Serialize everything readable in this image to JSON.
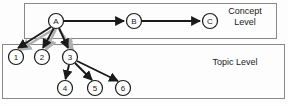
{
  "figure": {
    "background_color": "#ffffff",
    "stroke_color": "#1a1a1a",
    "shadow_color": "#a8a8a8",
    "box_border_color": "#7a7a7a",
    "width": 288,
    "height": 106
  },
  "groups": [
    {
      "id": "concept-level",
      "label": "Concept",
      "label_line2": "Level",
      "label_full": "Concept Level",
      "x": 24,
      "y": 3,
      "w": 253,
      "h": 36
    },
    {
      "id": "topic-level",
      "label": "Topic Level",
      "label_full": "Topic Level",
      "x": 2,
      "y": 44,
      "w": 283,
      "h": 55
    }
  ],
  "nodes": [
    {
      "id": "A",
      "label": "A",
      "cx": 56,
      "cy": 21,
      "r": 7.5,
      "level": "concept"
    },
    {
      "id": "B",
      "label": "B",
      "cx": 134,
      "cy": 21,
      "r": 7.5,
      "level": "concept"
    },
    {
      "id": "C",
      "label": "C",
      "cx": 210,
      "cy": 21,
      "r": 7.5,
      "level": "concept"
    },
    {
      "id": "1",
      "label": "1",
      "cx": 16,
      "cy": 57,
      "r": 7.5,
      "level": "topic"
    },
    {
      "id": "2",
      "label": "2",
      "cx": 42,
      "cy": 57,
      "r": 7.5,
      "level": "topic"
    },
    {
      "id": "3",
      "label": "3",
      "cx": 70,
      "cy": 57,
      "r": 7.5,
      "level": "topic"
    },
    {
      "id": "4",
      "label": "4",
      "cx": 65,
      "cy": 88,
      "r": 7.5,
      "level": "topic"
    },
    {
      "id": "5",
      "label": "5",
      "cx": 95,
      "cy": 88,
      "r": 7.5,
      "level": "topic"
    },
    {
      "id": "6",
      "label": "6",
      "cx": 123,
      "cy": 88,
      "r": 7.5,
      "level": "topic"
    }
  ],
  "edges": [
    {
      "id": "A-B",
      "from": "A",
      "to": "B",
      "style": "solid-black"
    },
    {
      "id": "B-C",
      "from": "B",
      "to": "C",
      "style": "solid-black"
    },
    {
      "id": "A-1",
      "from": "A",
      "to": "1",
      "style": "solid-black"
    },
    {
      "id": "A-2",
      "from": "A",
      "to": "2",
      "style": "solid-black"
    },
    {
      "id": "A-3",
      "from": "A",
      "to": "3",
      "style": "solid-black"
    },
    {
      "id": "A-1-shadow",
      "from": "A",
      "to": "1",
      "style": "shadow-gray"
    },
    {
      "id": "A-2-shadow",
      "from": "A",
      "to": "2",
      "style": "shadow-gray"
    },
    {
      "id": "A-3-shadow",
      "from": "A",
      "to": "3",
      "style": "shadow-gray"
    },
    {
      "id": "3-4",
      "from": "3",
      "to": "4",
      "style": "solid-black"
    },
    {
      "id": "3-5",
      "from": "3",
      "to": "5",
      "style": "solid-black"
    },
    {
      "id": "3-6",
      "from": "3",
      "to": "6",
      "style": "solid-black"
    }
  ],
  "labels": {
    "concept_line1": "Concept",
    "concept_line2": "Level",
    "topic": "Topic Level"
  }
}
